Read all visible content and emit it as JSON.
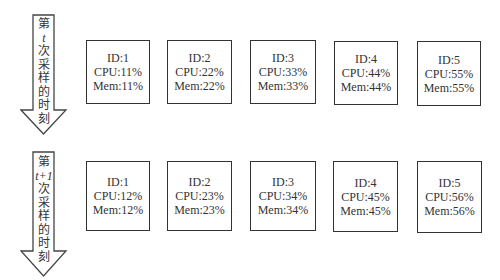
{
  "arrows": [
    {
      "label_chars": [
        "第",
        "t",
        "次",
        "采",
        "样",
        "的",
        "时",
        "刻"
      ],
      "variable": "t"
    },
    {
      "label_chars": [
        "第",
        "t+1",
        "次",
        "采",
        "样",
        "的",
        "时",
        "刻"
      ],
      "variable": "t+1"
    }
  ],
  "rows": [
    {
      "boxes": [
        {
          "id": "ID:1",
          "cpu": "CPU:11%",
          "mem": "Mem:11%"
        },
        {
          "id": "ID:2",
          "cpu": "CPU:22%",
          "mem": "Mem:22%"
        },
        {
          "id": "ID:3",
          "cpu": "CPU:33%",
          "mem": "Mem:33%"
        },
        {
          "id": "ID:4",
          "cpu": "CPU:44%",
          "mem": "Mem:44%"
        },
        {
          "id": "ID:5",
          "cpu": "CPU:55%",
          "mem": "Mem:55%"
        }
      ]
    },
    {
      "boxes": [
        {
          "id": "ID:1",
          "cpu": "CPU:12%",
          "mem": "Mem:12%"
        },
        {
          "id": "ID:2",
          "cpu": "CPU:23%",
          "mem": "Mem:23%"
        },
        {
          "id": "ID:3",
          "cpu": "CPU:34%",
          "mem": "Mem:34%"
        },
        {
          "id": "ID:4",
          "cpu": "CPU:45%",
          "mem": "Mem:45%"
        },
        {
          "id": "ID:5",
          "cpu": "CPU:56%",
          "mem": "Mem:56%"
        }
      ]
    }
  ]
}
